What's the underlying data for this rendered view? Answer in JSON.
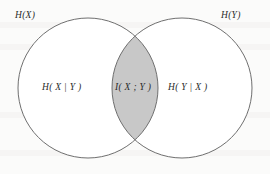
{
  "figure": {
    "type": "venn-diagram",
    "background_color": "#fbfbfa",
    "stroke_color": "#6f6f6f",
    "fill_color": "#ffffff",
    "intersection_fill_color": "#c8c8c8",
    "text_color": "#2b2b2b"
  },
  "labels": {
    "left_circle_outer": "H(X)",
    "right_circle_outer": "H(Y)",
    "left_only_region": "H( X | Y )",
    "intersection_region": "I( X ; Y )",
    "right_only_region": "H( Y | X )"
  },
  "geometry": {
    "left_circle": {
      "cx": 88,
      "cy": 88,
      "r": 70
    },
    "right_circle": {
      "cx": 182,
      "cy": 88,
      "r": 70
    }
  }
}
